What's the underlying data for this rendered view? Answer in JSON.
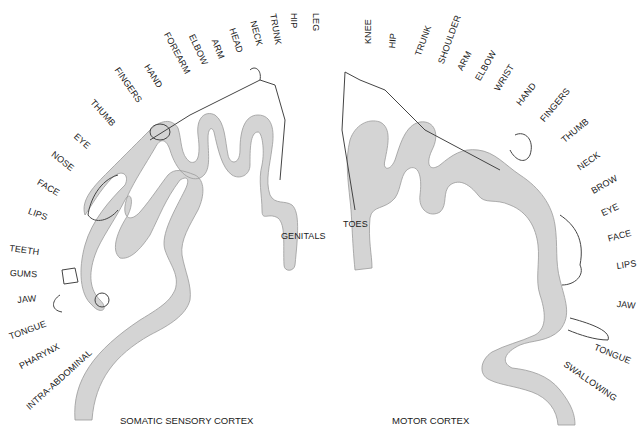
{
  "colors": {
    "cortex_fill": "#d4d4d4",
    "cortex_edge": "#9a9a9a",
    "ink": "#1a1a1a",
    "background": "#ffffff"
  },
  "sensory": {
    "title": "SOMATIC SENSORY CORTEX",
    "labels": [
      "LEG",
      "HIP",
      "TRUNK",
      "NECK",
      "HEAD",
      "ARM",
      "ELBOW",
      "FOREARM",
      "HAND",
      "FINGERS",
      "THUMB",
      "EYE",
      "NOSE",
      "FACE",
      "LIPS",
      "TEETH",
      "GUMS",
      "JAW",
      "TONGUE",
      "PHARYNX",
      "INTRA-ABDOMINAL"
    ],
    "inner_label": "GENITALS"
  },
  "motor": {
    "title": "MOTOR CORTEX",
    "labels": [
      "KNEE",
      "HIP",
      "TRUNK",
      "SHOULDER",
      "ARM",
      "ELBOW",
      "WRIST",
      "HAND",
      "FINGERS",
      "THUMB",
      "NECK",
      "BROW",
      "EYE",
      "FACE",
      "LIPS",
      "JAW",
      "TONGUE",
      "SWALLOWING"
    ],
    "inner_label": "TOES"
  },
  "icons": {
    "homunculus_sensory": "sensory-homunculus-figure",
    "homunculus_motor": "motor-homunculus-figure"
  }
}
